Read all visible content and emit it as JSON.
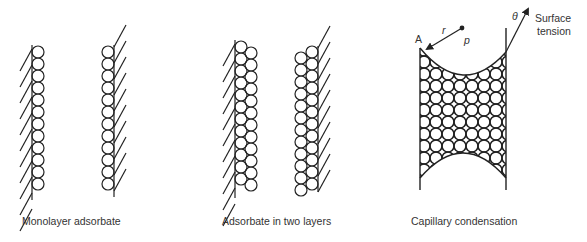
{
  "panels": [
    {
      "id": "monolayer",
      "caption": "Monolayer adsorbate"
    },
    {
      "id": "two-layers",
      "caption": "Adsorbate in two layers"
    },
    {
      "id": "capillary",
      "caption": "Capillary condensation"
    }
  ],
  "capillary_labels": {
    "point_a": "A",
    "radius": "r",
    "pressure": "p",
    "angle": "θ",
    "force_line1": "Surface",
    "force_line2": "tension"
  },
  "colors": {
    "stroke": "#222222",
    "text": "#333333",
    "background": "#ffffff"
  }
}
